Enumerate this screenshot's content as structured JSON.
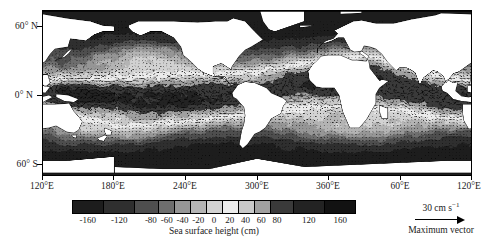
{
  "figure": {
    "type": "map-chart",
    "domain": "oceanography"
  },
  "chart_data": {
    "type": "heatmap",
    "title": "",
    "subtitle": "",
    "xlabel": "",
    "ylabel": "",
    "colorbar_label": "Sea surface height (cm)",
    "grid": false,
    "projection": "cylindrical-equidistant",
    "xlim": [
      120,
      480
    ],
    "ylim": [
      -80,
      80
    ],
    "x_tick_labels": [
      "120°E",
      "180°E",
      "240°E",
      "300°E",
      "360°E",
      "60°E",
      "120°E"
    ],
    "x_tick_values": [
      120,
      180,
      240,
      300,
      360,
      420,
      480
    ],
    "y_tick_labels": [
      "60° N",
      "0° N",
      "60° S"
    ],
    "y_tick_values": [
      60,
      0,
      -60
    ],
    "colorbar": {
      "ticks": [
        -160,
        -120,
        -80,
        -60,
        -40,
        -20,
        0,
        20,
        40,
        60,
        80,
        120,
        160
      ],
      "tick_labels": [
        "-160",
        "-120",
        "-80",
        "-60",
        "-40",
        "-20",
        "0",
        "20",
        "40",
        "60",
        "80",
        "120",
        "160"
      ],
      "range": [
        -180,
        180
      ],
      "segment_edges": [
        -180,
        -140,
        -100,
        -70,
        -50,
        -30,
        -10,
        10,
        30,
        50,
        70,
        100,
        140,
        180
      ],
      "segment_colors": [
        "#1d1d1d",
        "#2f2f2f",
        "#4e4e4e",
        "#6e6e6e",
        "#969696",
        "#b4b4b4",
        "#d2d2d2",
        "#ececec",
        "#c8c8c8",
        "#a0a0a0",
        "#3a3a3a",
        "#232323",
        "#121212"
      ],
      "orientation": "horizontal"
    },
    "vector_legend": {
      "value": "30 cm s",
      "exponent": "−1",
      "caption": "Maximum vector",
      "arrow": "right-arrow"
    },
    "land_color": "#ffffff",
    "background_color": "#000000",
    "overlay": "current-velocity-vectors"
  },
  "colors": {
    "frame": "#000000",
    "text": "#1a1a1a",
    "land": "#ffffff",
    "missing": "#000000"
  }
}
